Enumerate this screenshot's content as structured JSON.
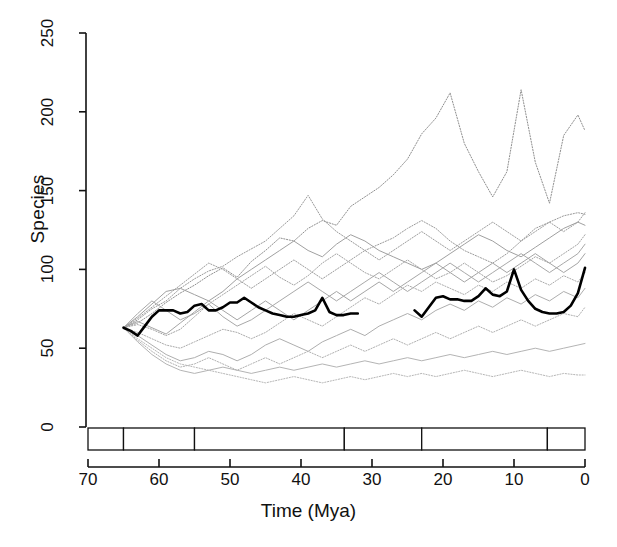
{
  "chart_data": {
    "type": "line",
    "title": "",
    "xlabel": "Time (Mya)",
    "ylabel": "Species",
    "xlim": [
      70,
      0
    ],
    "ylim": [
      0,
      250
    ],
    "x_ticks": [
      70,
      60,
      50,
      40,
      30,
      20,
      10,
      0
    ],
    "y_ticks": [
      0,
      50,
      100,
      150,
      200,
      250
    ],
    "x_reversed": true,
    "grid": false,
    "legend": null,
    "axis_color": "#111111",
    "timescale": {
      "name": "geologic-epochs",
      "bands": [
        {
          "label": "K",
          "start": 70,
          "end": 65
        },
        {
          "label": "Pal.",
          "start": 65,
          "end": 55
        },
        {
          "label": "Eocene",
          "start": 55,
          "end": 33.9
        },
        {
          "label": "Olig.",
          "start": 33.9,
          "end": 23
        },
        {
          "label": "Miocene",
          "start": 23,
          "end": 5.3
        },
        {
          "label": "Pl|Pl",
          "start": 5.3,
          "end": 0
        }
      ]
    },
    "series": [
      {
        "name": "observed-richness",
        "style": "solid",
        "color": "#000000",
        "width": 2.6,
        "emphasis": true,
        "segments": [
          {
            "x": [
              65,
              64,
              63,
              62,
              61,
              60,
              59,
              58,
              57,
              56,
              55,
              54,
              53,
              52,
              51,
              50,
              49,
              48,
              47,
              46,
              45,
              44,
              43,
              42,
              41,
              40,
              39,
              38,
              37,
              36,
              35,
              34,
              33,
              32
            ],
            "y": [
              63,
              61,
              58,
              64,
              70,
              74,
              74,
              74,
              72,
              73,
              77,
              78,
              74,
              74,
              76,
              79,
              79,
              82,
              79,
              76,
              74,
              72,
              71,
              70,
              70,
              71,
              72,
              74,
              82,
              73,
              71,
              71,
              72,
              72
            ]
          },
          {
            "x": [
              24,
              23,
              22,
              21,
              20,
              19,
              18,
              17,
              16,
              15,
              14,
              13,
              12,
              11,
              10,
              9,
              8,
              7,
              6,
              5,
              4,
              3,
              2,
              1,
              0
            ],
            "y": [
              74,
              70,
              76,
              82,
              83,
              81,
              81,
              80,
              80,
              83,
              88,
              84,
              83,
              86,
              100,
              87,
              80,
              75,
              73,
              72,
              72,
              73,
              77,
              85,
              101
            ]
          }
        ]
      },
      {
        "name": "sim-1",
        "style": "dotted",
        "color": "#8f8f8f",
        "width": 1,
        "x": [
          65,
          63,
          61,
          59,
          57,
          55,
          53,
          51,
          49,
          47,
          45,
          43,
          41,
          39,
          37,
          35,
          33,
          31,
          29,
          27,
          25,
          23,
          21,
          19,
          17,
          15,
          13,
          11,
          9,
          7,
          5,
          3,
          1,
          0
        ],
        "y": [
          63,
          66,
          72,
          79,
          85,
          90,
          96,
          101,
          95,
          105,
          112,
          120,
          118,
          126,
          131,
          128,
          140,
          146,
          152,
          160,
          170,
          186,
          196,
          212,
          180,
          162,
          146,
          162,
          214,
          168,
          142,
          185,
          198,
          188
        ]
      },
      {
        "name": "sim-2",
        "style": "dotted",
        "color": "#9a9a9a",
        "width": 1,
        "x": [
          65,
          63,
          61,
          59,
          57,
          55,
          53,
          51,
          49,
          47,
          45,
          43,
          41,
          39,
          37,
          35,
          33,
          31,
          29,
          27,
          25,
          23,
          21,
          19,
          17,
          15,
          13,
          11,
          9,
          7,
          5,
          3,
          1,
          0
        ],
        "y": [
          63,
          68,
          75,
          80,
          88,
          94,
          99,
          102,
          108,
          113,
          118,
          126,
          134,
          147,
          132,
          124,
          118,
          112,
          116,
          120,
          126,
          131,
          126,
          118,
          112,
          108,
          104,
          110,
          118,
          126,
          130,
          134,
          136,
          135
        ]
      },
      {
        "name": "sim-3",
        "style": "solid",
        "color": "#a0a0a0",
        "width": 1,
        "x": [
          65,
          63,
          61,
          59,
          57,
          55,
          53,
          51,
          49,
          47,
          45,
          43,
          41,
          39,
          37,
          35,
          33,
          31,
          29,
          27,
          25,
          23,
          21,
          19,
          17,
          15,
          13,
          11,
          9,
          7,
          5,
          3,
          1,
          0
        ],
        "y": [
          63,
          70,
          78,
          86,
          88,
          84,
          80,
          86,
          94,
          100,
          106,
          112,
          118,
          112,
          108,
          116,
          122,
          118,
          112,
          108,
          104,
          100,
          104,
          110,
          116,
          122,
          118,
          112,
          108,
          114,
          120,
          126,
          130,
          128
        ]
      },
      {
        "name": "sim-4",
        "style": "dotted",
        "color": "#a3a3a3",
        "width": 1,
        "x": [
          65,
          63,
          61,
          59,
          57,
          55,
          53,
          51,
          49,
          47,
          45,
          43,
          41,
          39,
          37,
          35,
          33,
          31,
          29,
          27,
          25,
          23,
          21,
          19,
          17,
          15,
          13,
          11,
          9,
          7,
          5,
          3,
          1,
          0
        ],
        "y": [
          63,
          65,
          62,
          58,
          62,
          70,
          78,
          84,
          90,
          96,
          102,
          95,
          90,
          96,
          104,
          110,
          104,
          98,
          94,
          100,
          106,
          100,
          94,
          98,
          104,
          98,
          92,
          96,
          102,
          108,
          104,
          110,
          116,
          122
        ]
      },
      {
        "name": "sim-5",
        "style": "solid",
        "color": "#a8a8a8",
        "width": 1,
        "x": [
          65,
          63,
          61,
          59,
          57,
          55,
          53,
          51,
          49,
          47,
          45,
          43,
          41,
          39,
          37,
          35,
          33,
          31,
          29,
          27,
          25,
          23,
          21,
          19,
          17,
          15,
          13,
          11,
          9,
          7,
          5,
          3,
          1,
          0
        ],
        "y": [
          63,
          72,
          80,
          74,
          68,
          72,
          78,
          70,
          64,
          68,
          74,
          80,
          86,
          92,
          86,
          80,
          86,
          92,
          98,
          92,
          86,
          92,
          98,
          104,
          98,
          92,
          98,
          104,
          110,
          104,
          98,
          104,
          110,
          116
        ]
      },
      {
        "name": "sim-6",
        "style": "dotted",
        "color": "#ababab",
        "width": 1,
        "x": [
          65,
          63,
          61,
          59,
          57,
          55,
          53,
          51,
          49,
          47,
          45,
          43,
          41,
          39,
          37,
          35,
          33,
          31,
          29,
          27,
          25,
          23,
          21,
          19,
          17,
          15,
          13,
          11,
          9,
          7,
          5,
          3,
          1,
          0
        ],
        "y": [
          63,
          60,
          56,
          52,
          50,
          54,
          58,
          62,
          60,
          56,
          60,
          66,
          72,
          68,
          64,
          70,
          76,
          82,
          78,
          84,
          90,
          86,
          92,
          88,
          84,
          90,
          86,
          92,
          88,
          94,
          90,
          96,
          92,
          98
        ]
      },
      {
        "name": "sim-7",
        "style": "solid",
        "color": "#aeaeae",
        "width": 1,
        "x": [
          65,
          63,
          61,
          59,
          57,
          55,
          53,
          51,
          49,
          47,
          45,
          43,
          41,
          39,
          37,
          35,
          33,
          31,
          29,
          27,
          25,
          23,
          21,
          19,
          17,
          15,
          13,
          11,
          9,
          7,
          5,
          3,
          1,
          0
        ],
        "y": [
          63,
          58,
          52,
          46,
          42,
          44,
          48,
          46,
          42,
          46,
          52,
          56,
          52,
          48,
          54,
          58,
          62,
          58,
          64,
          68,
          72,
          68,
          74,
          78,
          74,
          80,
          76,
          82,
          78,
          84,
          80,
          86,
          82,
          88
        ]
      },
      {
        "name": "sim-8",
        "style": "dotted",
        "color": "#b0b0b0",
        "width": 1,
        "x": [
          65,
          63,
          61,
          59,
          57,
          55,
          53,
          51,
          49,
          47,
          45,
          43,
          41,
          39,
          37,
          35,
          33,
          31,
          29,
          27,
          25,
          23,
          21,
          19,
          17,
          15,
          13,
          11,
          9,
          7,
          5,
          3,
          1,
          0
        ],
        "y": [
          63,
          55,
          48,
          42,
          38,
          40,
          44,
          40,
          36,
          40,
          44,
          40,
          44,
          48,
          44,
          48,
          52,
          48,
          52,
          56,
          52,
          56,
          60,
          56,
          60,
          64,
          60,
          64,
          68,
          64,
          68,
          72,
          70,
          76
        ]
      },
      {
        "name": "sim-9",
        "style": "solid",
        "color": "#b4b4b4",
        "width": 1,
        "x": [
          65,
          63,
          61,
          59,
          57,
          55,
          53,
          51,
          49,
          47,
          45,
          43,
          41,
          39,
          37,
          35,
          33,
          31,
          29,
          27,
          25,
          23,
          21,
          19,
          17,
          15,
          13,
          11,
          9,
          7,
          5,
          3,
          1,
          0
        ],
        "y": [
          63,
          54,
          46,
          40,
          36,
          34,
          36,
          38,
          36,
          34,
          36,
          38,
          36,
          38,
          40,
          38,
          40,
          42,
          40,
          42,
          44,
          42,
          44,
          46,
          44,
          46,
          48,
          46,
          48,
          50,
          48,
          50,
          52,
          53
        ]
      },
      {
        "name": "sim-10",
        "style": "dotted",
        "color": "#b6b6b6",
        "width": 1,
        "x": [
          65,
          63,
          61,
          59,
          57,
          55,
          53,
          51,
          49,
          47,
          45,
          43,
          41,
          39,
          37,
          35,
          33,
          31,
          29,
          27,
          25,
          23,
          21,
          19,
          17,
          15,
          13,
          11,
          9,
          7,
          5,
          3,
          1,
          0
        ],
        "y": [
          63,
          56,
          50,
          44,
          40,
          38,
          36,
          34,
          32,
          30,
          28,
          30,
          32,
          30,
          28,
          30,
          32,
          30,
          32,
          34,
          32,
          34,
          32,
          34,
          36,
          34,
          32,
          34,
          36,
          34,
          32,
          34,
          33,
          33
        ]
      },
      {
        "name": "sim-11",
        "style": "dotted",
        "color": "#9d9d9d",
        "width": 1,
        "x": [
          65,
          63,
          61,
          59,
          57,
          55,
          53,
          51,
          49,
          47,
          45,
          43,
          41,
          39,
          37,
          35,
          33,
          31,
          29,
          27,
          25,
          23,
          21,
          19,
          17,
          15,
          13,
          11,
          9,
          7,
          5,
          3,
          1,
          0
        ],
        "y": [
          63,
          69,
          76,
          83,
          90,
          97,
          104,
          100,
          94,
          88,
          94,
          100,
          106,
          100,
          94,
          100,
          106,
          112,
          106,
          112,
          118,
          124,
          118,
          112,
          118,
          124,
          130,
          124,
          118,
          124,
          130,
          124,
          130,
          136
        ]
      },
      {
        "name": "sim-12",
        "style": "solid",
        "color": "#a5a5a5",
        "width": 1,
        "x": [
          65,
          63,
          61,
          59,
          57,
          55,
          53,
          51,
          49,
          47,
          45,
          43,
          41,
          39,
          37,
          35,
          33,
          31,
          29,
          27,
          25,
          23,
          21,
          19,
          17,
          15,
          13,
          11,
          9,
          7,
          5,
          3,
          1,
          0
        ],
        "y": [
          63,
          67,
          63,
          59,
          66,
          73,
          80,
          74,
          68,
          74,
          80,
          74,
          68,
          74,
          80,
          86,
          80,
          86,
          92,
          86,
          92,
          98,
          104,
          98,
          92,
          98,
          104,
          98,
          104,
          110,
          104,
          98,
          104,
          110
        ]
      }
    ]
  },
  "axis": {
    "y_tick_labels": [
      "0",
      "50",
      "100",
      "150",
      "200",
      "250"
    ],
    "x_tick_labels": [
      "70",
      "60",
      "50",
      "40",
      "30",
      "20",
      "10",
      "0"
    ]
  }
}
